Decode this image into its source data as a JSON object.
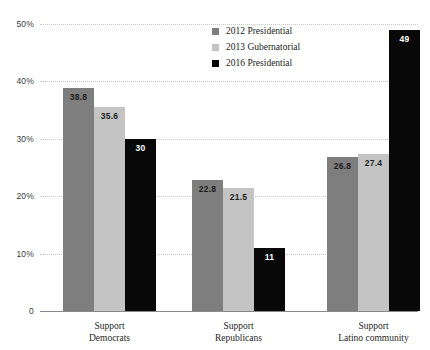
{
  "chart_data": {
    "type": "bar",
    "title": "",
    "subtitle": "",
    "xlabel": "",
    "ylabel": "",
    "ylim": [
      0,
      50
    ],
    "grid": true,
    "legend_position": "top-center",
    "categories": [
      [
        "Support",
        "Democrats"
      ],
      [
        "Support",
        "Republicans"
      ],
      [
        "Support",
        "Latino community"
      ]
    ],
    "ytick_labels": [
      "0",
      "10%",
      "20%",
      "30%",
      "40%",
      "50%"
    ],
    "ytick_values": [
      0,
      10,
      20,
      30,
      40,
      50
    ],
    "series": [
      {
        "name": "2012 Presidential",
        "color": "#7e7e7e",
        "values": [
          38.8,
          22.8,
          26.8
        ],
        "labels": [
          "38.8",
          "22.8",
          "26.8"
        ]
      },
      {
        "name": "2013 Gubernatorial",
        "color": "#c4c4c4",
        "values": [
          35.6,
          21.5,
          27.4
        ],
        "labels": [
          "35.6",
          "21.5",
          "27.4"
        ]
      },
      {
        "name": "2016 Presidential",
        "color": "#080808",
        "values": [
          30,
          11,
          49
        ],
        "labels": [
          "30",
          "11",
          "49"
        ]
      }
    ]
  },
  "colors": {
    "background": "#ffffff",
    "gridline": "#c9c9c9",
    "axis": "#8a8a8a",
    "tick_text": "#3b3b3b",
    "label_text": "#262626",
    "value_on_light": "#1d1d1d",
    "value_on_dark": "#ffffff"
  }
}
